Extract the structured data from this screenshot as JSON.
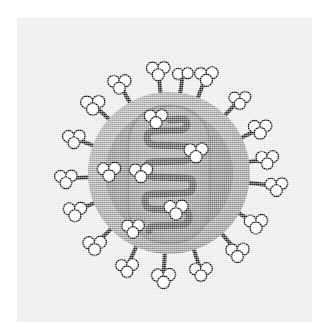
{
  "figure": {
    "caption": "",
    "background_color": "#ffffff",
    "panel_color": "#e9e9e7",
    "panel": {
      "x": 17,
      "y": 18,
      "width": 295,
      "height": 304
    }
  },
  "palette": {
    "panel_bg": "#e9e9e7",
    "envelope_outer": "#9b9b99",
    "envelope_inner": "#7e7e7c",
    "nucleocapsid_fill": "#8c8c8a",
    "nucleocapsid_edge": "#6f6f6d",
    "helix_stroke": "#4b4b49",
    "spike_stalk": "#1c1c1c",
    "spike_head_fill": "#fdfdfd",
    "spike_head_edge": "#101010"
  },
  "structures": {
    "virion": {
      "label": "virus-particle",
      "center_x": 169,
      "center_y": 173,
      "outer_radius": 81,
      "inner_radius": 64
    },
    "nucleocapsid": {
      "label": "nucleocapsid-capsule",
      "x": 128,
      "y": 106,
      "width": 82,
      "height": 137,
      "corner_radius": 38
    },
    "genome_helix": {
      "label": "rna-helix",
      "turns": 7,
      "stroke_width": 7,
      "path": "M 170 120 L 181 119 Q 187 119 187 124 Q 187 129 181 130 L 154 131 Q 147 131 147 138 Q 147 144 154 145 L 184 146 Q 191 146 191 153 Q 191 160 184 161 L 153 162 Q 146 162 146 169 Q 146 176 153 177 L 186 178 Q 193 178 193 185 Q 193 192 186 193 L 152 194 Q 145 194 145 201 Q 145 208 152 209 L 182 210 Q 189 210 189 217 Q 189 224 182 225 L 155 226 Q 149 226 149 231"
    }
  },
  "spikes": {
    "label": "glycoprotein-spikes",
    "count": 18,
    "items": [
      {
        "name": "spike-n",
        "angle_deg": -96,
        "stalk_len": 17,
        "heads": 3,
        "head_r": 6.0
      },
      {
        "name": "spike-nne",
        "angle_deg": -69,
        "stalk_len": 18,
        "heads": 3,
        "head_r": 6.0
      },
      {
        "name": "spike-ne",
        "angle_deg": -46,
        "stalk_len": 16,
        "heads": 3,
        "head_r": 5.6
      },
      {
        "name": "spike-ene",
        "angle_deg": -26,
        "stalk_len": 15,
        "heads": 3,
        "head_r": 6.0
      },
      {
        "name": "spike-e-upper",
        "angle_deg": -8,
        "stalk_len": 13,
        "heads": 3,
        "head_r": 5.8
      },
      {
        "name": "spike-e",
        "angle_deg": 7,
        "stalk_len": 22,
        "heads": 3,
        "head_r": 5.8
      },
      {
        "name": "spike-ese",
        "angle_deg": 30,
        "stalk_len": 14,
        "heads": 3,
        "head_r": 6.0
      },
      {
        "name": "spike-se",
        "angle_deg": 49,
        "stalk_len": 18,
        "heads": 3,
        "head_r": 6.0
      },
      {
        "name": "spike-sse",
        "angle_deg": 72,
        "stalk_len": 17,
        "heads": 3,
        "head_r": 5.8
      },
      {
        "name": "spike-s",
        "angle_deg": 93,
        "stalk_len": 18,
        "heads": 3,
        "head_r": 6.2
      },
      {
        "name": "spike-ssw",
        "angle_deg": 114,
        "stalk_len": 17,
        "heads": 3,
        "head_r": 5.8
      },
      {
        "name": "spike-sw",
        "angle_deg": 136,
        "stalk_len": 17,
        "heads": 3,
        "head_r": 6.0
      },
      {
        "name": "spike-wsw",
        "angle_deg": 158,
        "stalk_len": 15,
        "heads": 3,
        "head_r": 6.0
      },
      {
        "name": "spike-w",
        "angle_deg": 177,
        "stalk_len": 17,
        "heads": 3,
        "head_r": 5.8
      },
      {
        "name": "spike-wnw",
        "angle_deg": -160,
        "stalk_len": 15,
        "heads": 3,
        "head_r": 5.8
      },
      {
        "name": "spike-nw",
        "angle_deg": -138,
        "stalk_len": 16,
        "heads": 3,
        "head_r": 6.2
      },
      {
        "name": "spike-nnw",
        "angle_deg": -119,
        "stalk_len": 16,
        "heads": 3,
        "head_r": 6.0
      },
      {
        "name": "spike-n2",
        "angle_deg": -82,
        "stalk_len": 14,
        "heads": 2,
        "head_r": 5.6
      }
    ]
  },
  "internal_proteins": {
    "label": "matrix-protein-clusters",
    "count": 6,
    "items": [
      {
        "name": "protein-cluster-top",
        "cx": 156,
        "cy": 118,
        "heads": 3,
        "head_r": 6.0
      },
      {
        "name": "protein-cluster-upper-right",
        "cx": 196,
        "cy": 152,
        "heads": 3,
        "head_r": 6.2
      },
      {
        "name": "protein-cluster-left-mid",
        "cx": 141,
        "cy": 172,
        "heads": 3,
        "head_r": 6.0
      },
      {
        "name": "protein-cluster-outer-left",
        "cx": 109,
        "cy": 171,
        "heads": 3,
        "head_r": 6.0
      },
      {
        "name": "protein-cluster-lower-mid",
        "cx": 176,
        "cy": 209,
        "heads": 3,
        "head_r": 6.2
      },
      {
        "name": "protein-cluster-lower-left",
        "cx": 133,
        "cy": 228,
        "heads": 3,
        "head_r": 5.8
      }
    ]
  }
}
